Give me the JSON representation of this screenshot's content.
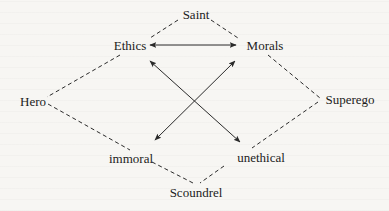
{
  "diagram": {
    "type": "semiotic-square",
    "nodes": {
      "saint": {
        "label": "Saint",
        "x": 196,
        "y": 14
      },
      "ethics": {
        "label": "Ethics",
        "x": 130,
        "y": 45
      },
      "morals": {
        "label": "Morals",
        "x": 265,
        "y": 45
      },
      "hero": {
        "label": "Hero",
        "x": 33,
        "y": 101
      },
      "superego": {
        "label": "Superego",
        "x": 350,
        "y": 99
      },
      "immoral": {
        "label": "immoral",
        "x": 131,
        "y": 158
      },
      "unethical": {
        "label": "unethical",
        "x": 261,
        "y": 157
      },
      "scoundrel": {
        "label": "Scoundrel",
        "x": 196,
        "y": 192
      }
    },
    "dashed_edges": [
      [
        "saint",
        "ethics"
      ],
      [
        "saint",
        "morals"
      ],
      [
        "ethics",
        "hero"
      ],
      [
        "morals",
        "superego"
      ],
      [
        "hero",
        "immoral"
      ],
      [
        "superego",
        "unethical"
      ],
      [
        "immoral",
        "scoundrel"
      ],
      [
        "unethical",
        "scoundrel"
      ]
    ],
    "arrow_edges": [
      {
        "from": "ethics",
        "to": "morals",
        "bidirectional": true
      },
      {
        "from": "ethics",
        "to": "unethical",
        "bidirectional": true
      },
      {
        "from": "morals",
        "to": "immoral",
        "bidirectional": true
      }
    ],
    "colors": {
      "line": "#2a2a2a",
      "background": "#f7f6f3"
    }
  }
}
